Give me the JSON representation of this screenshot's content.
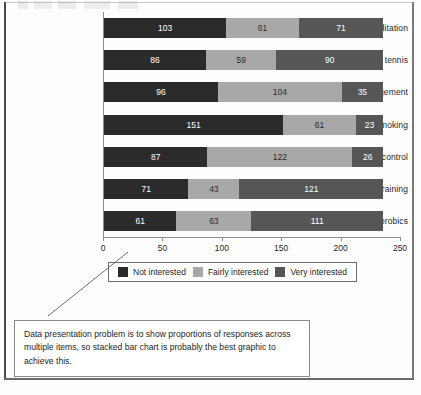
{
  "chart_data": {
    "type": "bar",
    "subtype": "stacked-horizontal",
    "title": "",
    "xlabel": "",
    "ylabel": "",
    "xlim": [
      0,
      250
    ],
    "xticks": [
      0,
      50,
      100,
      150,
      200,
      250
    ],
    "grid": false,
    "legend_position": "bottom",
    "categories": [
      "Meditation",
      "Table tennis",
      "Stress management",
      "Anti-smoking",
      "Weight loss/control",
      "Weight training",
      "Aerobics"
    ],
    "series": [
      {
        "name": "Not interested",
        "color": "#2b2b2b",
        "values": [
          103,
          86,
          96,
          151,
          87,
          71,
          61
        ]
      },
      {
        "name": "Fairly interested",
        "color": "#a8a8a8",
        "values": [
          61,
          59,
          104,
          61,
          122,
          43,
          63
        ]
      },
      {
        "name": "Very interested",
        "color": "#565656",
        "values": [
          71,
          90,
          35,
          23,
          26,
          121,
          111
        ]
      }
    ]
  },
  "legend": {
    "items": [
      {
        "label": "Not interested"
      },
      {
        "label": "Fairly interested"
      },
      {
        "label": "Very interested"
      }
    ]
  },
  "caption": {
    "text": "Data presentation problem is to show proportions of responses across multiple items, so stacked bar chart is probably the best graphic to achieve this."
  }
}
